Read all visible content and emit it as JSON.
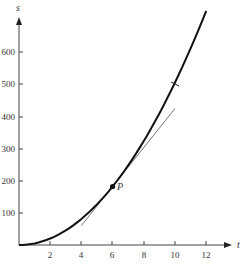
{
  "chart_data": {
    "type": "line",
    "title": "",
    "xlabel": "t",
    "ylabel": "s",
    "xlim": [
      0,
      13.5
    ],
    "ylim": [
      0,
      720
    ],
    "x_ticks": [
      2,
      4,
      6,
      8,
      10,
      12
    ],
    "y_ticks": [
      100,
      200,
      300,
      400,
      500,
      600
    ],
    "grid": false,
    "series": [
      {
        "name": "curve s = 5t^2",
        "x": [
          0,
          1,
          2,
          3,
          4,
          5,
          6,
          7,
          8,
          9,
          10,
          11,
          12
        ],
        "values": [
          0,
          5,
          20,
          45,
          80,
          125,
          180,
          245,
          320,
          405,
          500,
          605,
          720
        ]
      },
      {
        "name": "tangent line at P",
        "x": [
          4,
          10
        ],
        "values": [
          60,
          420
        ]
      }
    ],
    "annotations": [
      {
        "label": "P",
        "x": 6,
        "y": 180,
        "type": "point"
      },
      {
        "label": "",
        "x": 10,
        "y": 500,
        "type": "tick-mark-on-curve"
      }
    ]
  },
  "labels": {
    "x_axis": "t",
    "y_axis": "s",
    "point": "P",
    "x_ticks": [
      "2",
      "4",
      "6",
      "8",
      "10",
      "12"
    ],
    "y_ticks": [
      "100",
      "200",
      "300",
      "400",
      "500",
      "600"
    ]
  }
}
